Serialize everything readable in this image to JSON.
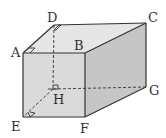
{
  "diagram": {
    "type": "cuboid",
    "vertices": {
      "A": {
        "label": "A",
        "x": 23,
        "y": 53
      },
      "B": {
        "label": "B",
        "x": 85,
        "y": 53
      },
      "C": {
        "label": "C",
        "x": 146,
        "y": 23
      },
      "D": {
        "label": "D",
        "x": 54,
        "y": 25
      },
      "E": {
        "label": "E",
        "x": 23,
        "y": 117
      },
      "F": {
        "label": "F",
        "x": 85,
        "y": 117
      },
      "G": {
        "label": "G",
        "x": 146,
        "y": 87
      },
      "H": {
        "label": "H",
        "x": 53,
        "y": 89
      }
    },
    "hidden_edges": [
      "DH",
      "HG",
      "HE"
    ],
    "right_angle_marks": [
      "A",
      "D",
      "H",
      "E"
    ],
    "colors": {
      "top_face": "#e6e6e6",
      "front_face": "#d9d9d9",
      "right_face": "#c4c4c4",
      "edge": "#333333"
    }
  }
}
